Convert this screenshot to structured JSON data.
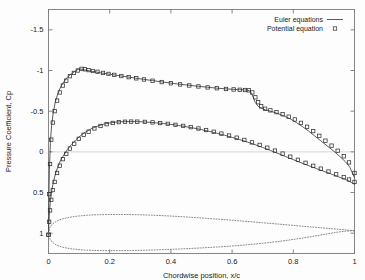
{
  "chart_data": {
    "type": "line",
    "title": "",
    "xlabel": "Chordwise position,  x/c",
    "ylabel": "Pressure Coefficient, Cp",
    "xlim": [
      0,
      1
    ],
    "ylim": [
      1.25,
      -1.75
    ],
    "y_inverted": true,
    "grid": false,
    "xticks": [
      0,
      0.2,
      0.4,
      0.6,
      0.8,
      1
    ],
    "xticklabels": [
      "0",
      "0.2",
      "0.4",
      "0.6",
      "0.8",
      "1"
    ],
    "yticks": [
      -1.5,
      -1,
      -0.5,
      0,
      0.5,
      1
    ],
    "yticklabels": [
      "-1.5",
      "-1",
      "-0.5",
      "0",
      "0.5",
      "1"
    ],
    "legend": {
      "position": "top-right",
      "entries": [
        {
          "label": "Euler equations",
          "style": "line",
          "color": "#4a4a4a"
        },
        {
          "label": "Potential equation",
          "style": "square-marker",
          "color": "#3a3a3a"
        }
      ]
    },
    "series": [
      {
        "name": "Euler equations - upper surface",
        "style": "line",
        "x": [
          0.0,
          0.001,
          0.003,
          0.006,
          0.01,
          0.015,
          0.022,
          0.03,
          0.04,
          0.05,
          0.062,
          0.075,
          0.088,
          0.1,
          0.11,
          0.12,
          0.135,
          0.15,
          0.17,
          0.19,
          0.21,
          0.235,
          0.26,
          0.285,
          0.31,
          0.34,
          0.37,
          0.4,
          0.43,
          0.46,
          0.49,
          0.52,
          0.55,
          0.58,
          0.605,
          0.625,
          0.64,
          0.65,
          0.658,
          0.664,
          0.67,
          0.676,
          0.685,
          0.695,
          0.71,
          0.73,
          0.75,
          0.77,
          0.79,
          0.81,
          0.83,
          0.85,
          0.87,
          0.89,
          0.91,
          0.93,
          0.95,
          0.97,
          0.985,
          1.0
        ],
        "y": [
          1.02,
          0.6,
          0.22,
          -0.1,
          -0.32,
          -0.47,
          -0.61,
          -0.71,
          -0.8,
          -0.86,
          -0.92,
          -0.96,
          -0.995,
          -1.02,
          -1.015,
          -1.005,
          -0.995,
          -0.985,
          -0.972,
          -0.96,
          -0.948,
          -0.934,
          -0.92,
          -0.906,
          -0.892,
          -0.876,
          -0.86,
          -0.845,
          -0.831,
          -0.818,
          -0.806,
          -0.794,
          -0.783,
          -0.774,
          -0.768,
          -0.764,
          -0.761,
          -0.759,
          -0.75,
          -0.715,
          -0.66,
          -0.605,
          -0.56,
          -0.535,
          -0.515,
          -0.495,
          -0.47,
          -0.44,
          -0.405,
          -0.36,
          -0.31,
          -0.255,
          -0.195,
          -0.135,
          -0.075,
          -0.015,
          0.05,
          0.12,
          0.19,
          0.32
        ]
      },
      {
        "name": "Euler equations - lower surface",
        "style": "line",
        "x": [
          0.0,
          0.001,
          0.003,
          0.006,
          0.01,
          0.015,
          0.022,
          0.03,
          0.04,
          0.05,
          0.062,
          0.075,
          0.09,
          0.105,
          0.12,
          0.14,
          0.16,
          0.18,
          0.2,
          0.22,
          0.24,
          0.26,
          0.28,
          0.3,
          0.325,
          0.35,
          0.375,
          0.4,
          0.425,
          0.45,
          0.475,
          0.5,
          0.525,
          0.55,
          0.575,
          0.6,
          0.625,
          0.65,
          0.675,
          0.7,
          0.725,
          0.75,
          0.775,
          0.8,
          0.825,
          0.85,
          0.875,
          0.9,
          0.925,
          0.95,
          0.97,
          0.985,
          1.0
        ],
        "y": [
          1.02,
          0.88,
          0.74,
          0.61,
          0.49,
          0.39,
          0.28,
          0.19,
          0.1,
          0.04,
          -0.03,
          -0.09,
          -0.15,
          -0.2,
          -0.24,
          -0.285,
          -0.315,
          -0.34,
          -0.355,
          -0.365,
          -0.37,
          -0.372,
          -0.372,
          -0.37,
          -0.365,
          -0.357,
          -0.348,
          -0.337,
          -0.324,
          -0.309,
          -0.292,
          -0.273,
          -0.252,
          -0.229,
          -0.204,
          -0.178,
          -0.15,
          -0.12,
          -0.088,
          -0.054,
          -0.018,
          0.02,
          0.058,
          0.096,
          0.134,
          0.17,
          0.205,
          0.24,
          0.275,
          0.31,
          0.34,
          0.365,
          0.4
        ]
      },
      {
        "name": "Potential equation - upper surface",
        "style": "square-marker",
        "x": [
          0.0,
          0.002,
          0.005,
          0.009,
          0.014,
          0.02,
          0.028,
          0.037,
          0.047,
          0.058,
          0.07,
          0.083,
          0.096,
          0.108,
          0.119,
          0.131,
          0.145,
          0.16,
          0.178,
          0.196,
          0.215,
          0.238,
          0.262,
          0.287,
          0.312,
          0.34,
          0.37,
          0.4,
          0.43,
          0.46,
          0.49,
          0.52,
          0.55,
          0.58,
          0.605,
          0.625,
          0.642,
          0.655,
          0.666,
          0.676,
          0.685,
          0.695,
          0.708,
          0.725,
          0.745,
          0.765,
          0.785,
          0.805,
          0.825,
          0.845,
          0.865,
          0.885,
          0.905,
          0.925,
          0.945,
          0.965,
          0.982,
          1.0
        ],
        "y": [
          1.02,
          0.52,
          0.15,
          -0.15,
          -0.36,
          -0.5,
          -0.63,
          -0.73,
          -0.815,
          -0.875,
          -0.93,
          -0.97,
          -1.0,
          -1.02,
          -1.015,
          -1.005,
          -0.994,
          -0.984,
          -0.97,
          -0.958,
          -0.946,
          -0.932,
          -0.918,
          -0.904,
          -0.89,
          -0.874,
          -0.858,
          -0.843,
          -0.829,
          -0.816,
          -0.804,
          -0.792,
          -0.782,
          -0.773,
          -0.767,
          -0.763,
          -0.76,
          -0.756,
          -0.73,
          -0.67,
          -0.61,
          -0.56,
          -0.53,
          -0.51,
          -0.488,
          -0.462,
          -0.432,
          -0.398,
          -0.356,
          -0.308,
          -0.255,
          -0.197,
          -0.137,
          -0.076,
          -0.013,
          0.055,
          0.13,
          0.26
        ]
      },
      {
        "name": "Potential equation - lower surface",
        "style": "square-marker",
        "x": [
          0.0,
          0.002,
          0.005,
          0.009,
          0.014,
          0.02,
          0.028,
          0.037,
          0.047,
          0.058,
          0.07,
          0.084,
          0.099,
          0.115,
          0.131,
          0.15,
          0.17,
          0.19,
          0.21,
          0.23,
          0.25,
          0.27,
          0.29,
          0.315,
          0.34,
          0.365,
          0.39,
          0.415,
          0.44,
          0.465,
          0.49,
          0.515,
          0.54,
          0.565,
          0.59,
          0.615,
          0.64,
          0.665,
          0.69,
          0.715,
          0.74,
          0.765,
          0.79,
          0.815,
          0.84,
          0.865,
          0.89,
          0.915,
          0.94,
          0.965,
          0.982,
          1.0
        ],
        "y": [
          1.02,
          0.86,
          0.72,
          0.59,
          0.47,
          0.37,
          0.26,
          0.17,
          0.09,
          0.025,
          -0.04,
          -0.1,
          -0.16,
          -0.21,
          -0.248,
          -0.288,
          -0.318,
          -0.34,
          -0.355,
          -0.365,
          -0.37,
          -0.372,
          -0.371,
          -0.368,
          -0.362,
          -0.354,
          -0.344,
          -0.332,
          -0.319,
          -0.304,
          -0.287,
          -0.268,
          -0.247,
          -0.224,
          -0.2,
          -0.174,
          -0.146,
          -0.116,
          -0.085,
          -0.051,
          -0.015,
          0.022,
          0.06,
          0.098,
          0.135,
          0.172,
          0.207,
          0.242,
          0.277,
          0.312,
          0.34,
          0.37
        ]
      },
      {
        "name": "Airfoil profile - upper (scaled, dotted)",
        "style": "dotted",
        "x": [
          0.0,
          0.005,
          0.012,
          0.022,
          0.035,
          0.05,
          0.07,
          0.095,
          0.125,
          0.155,
          0.19,
          0.225,
          0.26,
          0.3,
          0.34,
          0.38,
          0.42,
          0.46,
          0.5,
          0.54,
          0.58,
          0.62,
          0.66,
          0.7,
          0.74,
          0.78,
          0.82,
          0.86,
          0.9,
          0.94,
          0.97,
          1.0
        ],
        "y": [
          1.0,
          0.925,
          0.89,
          0.862,
          0.838,
          0.82,
          0.804,
          0.79,
          0.78,
          0.774,
          0.771,
          0.77,
          0.771,
          0.774,
          0.779,
          0.786,
          0.794,
          0.803,
          0.813,
          0.824,
          0.835,
          0.847,
          0.859,
          0.872,
          0.885,
          0.898,
          0.911,
          0.924,
          0.937,
          0.95,
          0.96,
          0.97
        ]
      },
      {
        "name": "Airfoil profile - lower (scaled, dotted)",
        "style": "dotted",
        "x": [
          0.0,
          0.005,
          0.012,
          0.022,
          0.035,
          0.05,
          0.07,
          0.095,
          0.125,
          0.155,
          0.19,
          0.225,
          0.26,
          0.3,
          0.34,
          0.38,
          0.42,
          0.46,
          0.5,
          0.54,
          0.58,
          0.62,
          0.66,
          0.7,
          0.74,
          0.78,
          0.82,
          0.86,
          0.9,
          0.94,
          0.97,
          1.0
        ],
        "y": [
          1.0,
          1.075,
          1.11,
          1.138,
          1.16,
          1.176,
          1.19,
          1.201,
          1.209,
          1.213,
          1.215,
          1.215,
          1.214,
          1.211,
          1.207,
          1.202,
          1.196,
          1.189,
          1.181,
          1.173,
          1.163,
          1.152,
          1.139,
          1.124,
          1.107,
          1.088,
          1.066,
          1.042,
          1.016,
          0.99,
          0.975,
          0.97
        ]
      }
    ]
  },
  "colors": {
    "line": "#4a4a4a",
    "marker": "#2f2f2f",
    "dotted": "#6b6b6b",
    "axis": "#7a7a7a",
    "zero_line": "#cfcfcf",
    "text": "#1a1a1a",
    "background": "#fdfdfd"
  }
}
